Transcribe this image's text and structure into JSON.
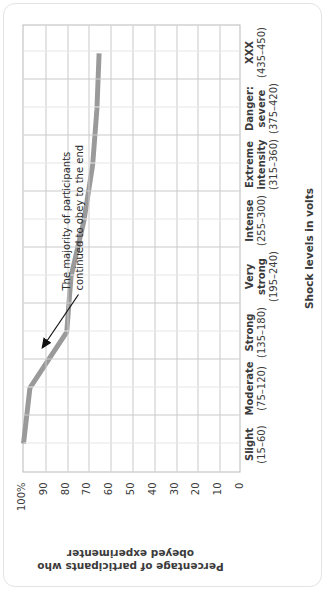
{
  "figure": {
    "y_axis_title": "Percentage of participants who obeyed experimenter",
    "x_axis_title": "Shock levels in volts",
    "annotation": "The majority of participants continued to obey to the end"
  },
  "chart_data": {
    "type": "line",
    "title": "",
    "xlabel": "Shock levels in volts",
    "ylabel": "Percentage of participants who obeyed experimenter",
    "ylim": [
      0,
      100
    ],
    "grid": true,
    "legend": "none",
    "categories": [
      "Slight (15–60)",
      "Moderate (75–120)",
      "Strong (135–180)",
      "Very strong (195–240)",
      "Intense (255–300)",
      "Extreme intensity (315–360)",
      "Danger: severe (375–420)",
      "XXX (435–450)"
    ],
    "category_names": [
      "Slight",
      "Moderate",
      "Strong",
      "Very strong",
      "Intense",
      "Extreme intensity",
      "Danger: severe",
      "XXX"
    ],
    "category_ranges": [
      "(15–60)",
      "(75–120)",
      "(135–180)",
      "(195–240)",
      "(255–300)",
      "(315–360)",
      "(375–420)",
      "(435–450)"
    ],
    "values": [
      100,
      97,
      80,
      78,
      72,
      68,
      66,
      65
    ],
    "ytick_labels": [
      "100%",
      "90",
      "80",
      "70",
      "60",
      "50",
      "40",
      "30",
      "20",
      "10",
      "0"
    ],
    "ytick_values": [
      100,
      90,
      80,
      70,
      60,
      50,
      40,
      30,
      20,
      10,
      0
    ],
    "series_color": "#9a9a9a",
    "grid_color": "#c9c9c9",
    "axis_color": "#b9b9b9",
    "text_color": "#3b3b3b",
    "annotation_text": "The majority of participants continued to obey to the end"
  }
}
